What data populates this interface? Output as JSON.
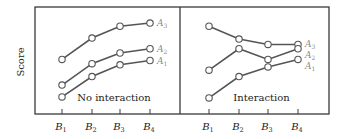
{
  "chart_data": {
    "type": "line",
    "ylabel": "Score",
    "ylim": [
      0,
      10
    ],
    "grid": false,
    "panels": [
      {
        "title": "No interaction",
        "categories": [
          "B1",
          "B2",
          "B3",
          "B4"
        ],
        "series": [
          {
            "name": "A3",
            "values": [
              5.1,
              7.1,
              8.2,
              8.5
            ]
          },
          {
            "name": "A2",
            "values": [
              2.7,
              4.7,
              5.7,
              6.1
            ]
          },
          {
            "name": "A1",
            "values": [
              1.6,
              3.5,
              4.6,
              5.0
            ]
          }
        ]
      },
      {
        "title": "Interaction",
        "categories": [
          "B1",
          "B2",
          "B3",
          "B4"
        ],
        "series": [
          {
            "name": "A3",
            "values": [
              8.2,
              7.0,
              6.5,
              6.5
            ]
          },
          {
            "name": "A2",
            "values": [
              4.1,
              6.1,
              5.1,
              6.1
            ]
          },
          {
            "name": "A1",
            "values": [
              1.5,
              3.5,
              4.4,
              5.1
            ]
          }
        ]
      }
    ]
  }
}
